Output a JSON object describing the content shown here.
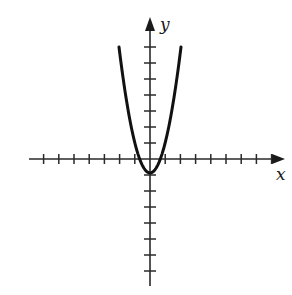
{
  "chart_data": {
    "type": "line",
    "title": "",
    "xlabel": "x",
    "ylabel": "y",
    "equation_hint": "y = a*x^2 - 1",
    "x_ticks": [
      -7,
      -6,
      -5,
      -4,
      -3,
      -2,
      -1,
      1,
      2,
      3,
      4,
      5,
      6,
      7,
      8
    ],
    "y_ticks": [
      -7,
      -6,
      -5,
      -4,
      -3,
      -2,
      -1,
      1,
      2,
      3,
      4,
      5,
      6,
      7
    ],
    "xlim": [
      -8,
      9
    ],
    "ylim": [
      -8,
      9
    ],
    "grid": false,
    "tick_labels_shown": false,
    "series": [
      {
        "name": "parabola",
        "vertex": [
          0,
          -1
        ],
        "points": [
          [
            -2,
            7
          ],
          [
            -1.5,
            3.5
          ],
          [
            -1,
            1
          ],
          [
            -0.5,
            -0.5
          ],
          [
            0,
            -1
          ],
          [
            0.5,
            -0.5
          ],
          [
            1,
            1
          ],
          [
            1.5,
            3.5
          ],
          [
            2,
            7
          ]
        ]
      }
    ]
  },
  "labels": {
    "x_axis": "x",
    "y_axis": "y"
  }
}
